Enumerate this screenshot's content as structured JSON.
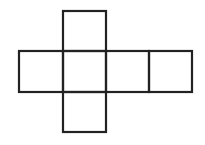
{
  "diagram": {
    "type": "cube-net",
    "stroke_color": "#222222",
    "background": "#ffffff",
    "faces": [
      {
        "id": "top",
        "x": 63,
        "y": 11,
        "w": 43,
        "h": 40
      },
      {
        "id": "left",
        "x": 19,
        "y": 51,
        "w": 44,
        "h": 41
      },
      {
        "id": "center",
        "x": 63,
        "y": 51,
        "w": 43,
        "h": 41
      },
      {
        "id": "right",
        "x": 106,
        "y": 51,
        "w": 43,
        "h": 41
      },
      {
        "id": "far-right",
        "x": 149,
        "y": 51,
        "w": 43,
        "h": 41
      },
      {
        "id": "bottom",
        "x": 63,
        "y": 92,
        "w": 43,
        "h": 40
      }
    ]
  }
}
